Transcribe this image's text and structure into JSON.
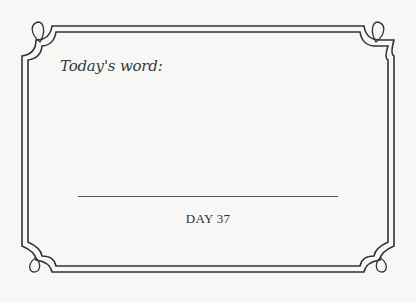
{
  "card": {
    "prompt_label": "Today's word:",
    "day_label": "DAY 37",
    "answer_value": ""
  },
  "colors": {
    "background": "#f7f7f6",
    "frame": "#333333",
    "text": "#3a3a3a"
  }
}
